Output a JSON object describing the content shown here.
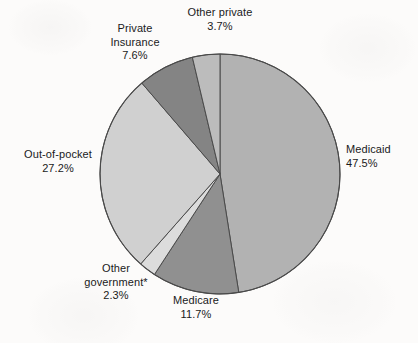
{
  "chart_data": {
    "type": "pie",
    "title": "",
    "subtitle": "",
    "xlabel": "",
    "ylabel": "",
    "legend_position": "none",
    "grid": false,
    "units": "percent",
    "start_angle_deg": 0,
    "direction": "clockwise",
    "categories": [
      "Medicaid",
      "Medicare",
      "Other government*",
      "Out-of-pocket",
      "Private Insurance",
      "Other private"
    ],
    "values": [
      47.5,
      11.7,
      2.3,
      27.2,
      7.6,
      3.7
    ],
    "slices": [
      {
        "label": "Medicaid",
        "label_lines": [
          "Medicaid"
        ],
        "value": 47.5,
        "value_text": "47.5%",
        "color": "#b2b2b2",
        "start_deg": 0.0,
        "end_deg": 171.0
      },
      {
        "label": "Medicare",
        "label_lines": [
          "Medicare"
        ],
        "value": 11.7,
        "value_text": "11.7%",
        "color": "#909090",
        "start_deg": 171.0,
        "end_deg": 213.12
      },
      {
        "label": "Other government*",
        "label_lines": [
          "Other",
          "government*"
        ],
        "value": 2.3,
        "value_text": "2.3%",
        "color": "#dcdcdc",
        "start_deg": 213.12,
        "end_deg": 221.4
      },
      {
        "label": "Out-of-pocket",
        "label_lines": [
          "Out-of-pocket"
        ],
        "value": 27.2,
        "value_text": "27.2%",
        "color": "#d0d0d0",
        "start_deg": 221.4,
        "end_deg": 319.32
      },
      {
        "label": "Private Insurance",
        "label_lines": [
          "Private",
          "Insurance"
        ],
        "value": 7.6,
        "value_text": "7.6%",
        "color": "#848484",
        "start_deg": 319.32,
        "end_deg": 346.68
      },
      {
        "label": "Other private",
        "label_lines": [
          "Other private"
        ],
        "value": 3.7,
        "value_text": "3.7%",
        "color": "#bcbcbc",
        "start_deg": 346.68,
        "end_deg": 360.0
      }
    ]
  },
  "labels": {
    "medicaid": {
      "name": "Medicaid",
      "value": "47.5%"
    },
    "medicare": {
      "name": "Medicare",
      "value": "11.7%"
    },
    "other_government": {
      "name_line1": "Other",
      "name_line2": "government*",
      "value": "2.3%"
    },
    "out_of_pocket": {
      "name": "Out-of-pocket",
      "value": "27.2%"
    },
    "private_insurance": {
      "name_line1": "Private",
      "name_line2": "Insurance",
      "value": "7.6%"
    },
    "other_private": {
      "name": "Other private",
      "value": "3.7%"
    }
  },
  "style": {
    "background": "#fcfbfa",
    "outline": "#4a4a4a",
    "text": "#1a1a1a"
  },
  "geometry": {
    "center_x": 220,
    "center_y": 174,
    "radius": 120
  }
}
